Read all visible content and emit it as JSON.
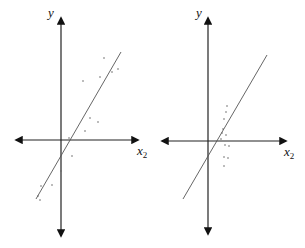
{
  "panels": [
    {
      "id": "left",
      "y_label": "y",
      "x_label": "x",
      "x_label_subscript": "2",
      "axes": {
        "vx": 61,
        "vtop": 18,
        "vbot": 236,
        "hy": 140,
        "hleft": 16,
        "hright": 138
      },
      "line": {
        "x1": 36,
        "y1": 199,
        "x2": 121,
        "y2": 52
      },
      "points": [
        [
          104,
          58
        ],
        [
          118,
          69
        ],
        [
          112,
          72
        ],
        [
          83,
          81
        ],
        [
          100,
          77
        ],
        [
          90,
          118
        ],
        [
          98,
          122
        ],
        [
          85,
          131
        ],
        [
          69,
          138
        ],
        [
          72,
          156
        ],
        [
          61,
          171
        ],
        [
          52,
          185
        ],
        [
          41,
          186
        ],
        [
          38,
          196
        ],
        [
          40,
          200
        ]
      ]
    },
    {
      "id": "right",
      "y_label": "y",
      "x_label": "x",
      "x_label_subscript": "2",
      "axes": {
        "vx": 208,
        "vtop": 18,
        "vbot": 234,
        "hy": 141,
        "hleft": 162,
        "hright": 286
      },
      "line": {
        "x1": 183,
        "y1": 199,
        "x2": 267,
        "y2": 55
      },
      "points": [
        [
          227,
          106
        ],
        [
          226,
          112
        ],
        [
          224,
          119
        ],
        [
          223,
          129
        ],
        [
          222,
          133
        ],
        [
          226,
          135
        ],
        [
          221,
          139
        ],
        [
          225,
          145
        ],
        [
          229,
          146
        ],
        [
          224,
          157
        ],
        [
          228,
          158
        ],
        [
          224,
          166
        ]
      ]
    }
  ],
  "colors": {
    "axis": "#222222",
    "line": "#555555",
    "points": "#666666"
  }
}
